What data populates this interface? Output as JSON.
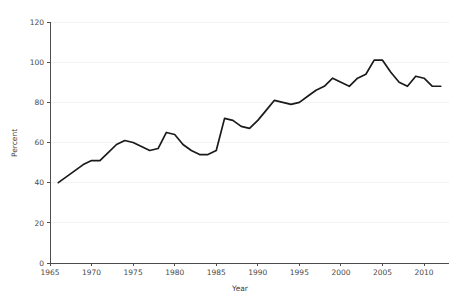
{
  "chart_data": {
    "type": "line",
    "title": "",
    "xlabel": "Year",
    "ylabel": "Percent",
    "xlim": [
      1965,
      2013
    ],
    "ylim": [
      0,
      120
    ],
    "grid": true,
    "legend": "none",
    "xticks": [
      1965,
      1970,
      1975,
      1980,
      1985,
      1990,
      1995,
      2000,
      2005,
      2010
    ],
    "yticks": [
      0,
      20,
      40,
      60,
      80,
      100,
      120
    ],
    "line_color": "#1a1a1a",
    "grid_color": "#f2f2f2",
    "axis_color": "#4d4d4d",
    "series": [
      {
        "name": "Percent",
        "x": [
          1966,
          1967,
          1968,
          1969,
          1970,
          1971,
          1972,
          1973,
          1974,
          1975,
          1976,
          1977,
          1978,
          1979,
          1980,
          1981,
          1982,
          1983,
          1984,
          1985,
          1986,
          1987,
          1988,
          1989,
          1990,
          1991,
          1992,
          1993,
          1994,
          1995,
          1996,
          1997,
          1998,
          1999,
          2000,
          2001,
          2002,
          2003,
          2004,
          2005,
          2006,
          2007,
          2008,
          2009,
          2010,
          2011,
          2012
        ],
        "values": [
          40,
          43,
          46,
          49,
          51,
          51,
          55,
          59,
          61,
          60,
          58,
          56,
          57,
          65,
          64,
          59,
          56,
          54,
          54,
          56,
          72,
          71,
          68,
          67,
          71,
          76,
          81,
          80,
          79,
          80,
          83,
          86,
          88,
          92,
          90,
          88,
          92,
          94,
          101,
          101,
          95,
          90,
          88,
          93,
          92,
          88,
          88
        ]
      }
    ]
  },
  "axis_titles": {
    "x": "Year",
    "y": "Percent"
  }
}
